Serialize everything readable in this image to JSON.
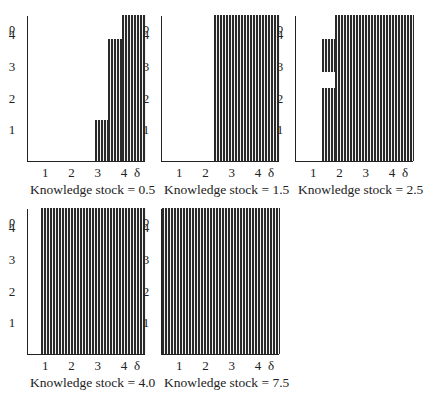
{
  "chart_data": [
    {
      "type": "area",
      "title": "Knowledge stock = 0.5",
      "xlabel": "δ",
      "ylabel": "ρ",
      "x_ticks": [
        "1",
        "2",
        "3",
        "4"
      ],
      "y_ticks": [
        "1",
        "2",
        "3",
        "4"
      ],
      "xlim": [
        0.3,
        4.8
      ],
      "ylim": [
        0,
        4.6
      ],
      "regions": [
        {
          "x_from": 2.85,
          "x_to": 3.35,
          "y_from": 0,
          "y_to": 1.3
        },
        {
          "x_from": 3.35,
          "x_to": 3.9,
          "y_from": 0,
          "y_to": 3.85
        },
        {
          "x_from": 3.9,
          "x_to": 4.8,
          "y_from": 0,
          "y_to": 4.6
        }
      ]
    },
    {
      "type": "area",
      "title": "Knowledge stock = 1.5",
      "xlabel": "δ",
      "ylabel": "ρ",
      "x_ticks": [
        "1",
        "2",
        "3",
        "4"
      ],
      "y_ticks": [
        "1",
        "2",
        "3",
        "4"
      ],
      "xlim": [
        0.3,
        4.8
      ],
      "ylim": [
        0,
        4.6
      ],
      "regions": [
        {
          "x_from": 2.3,
          "x_to": 4.8,
          "y_from": 0,
          "y_to": 4.6
        }
      ]
    },
    {
      "type": "area",
      "title": "Knowledge stock = 2.5",
      "xlabel": "δ",
      "ylabel": "ρ",
      "x_ticks": [
        "1",
        "2",
        "3",
        "4"
      ],
      "y_ticks": [
        "1",
        "2",
        "3",
        "4"
      ],
      "xlim": [
        0.3,
        4.8
      ],
      "ylim": [
        0,
        4.6
      ],
      "regions": [
        {
          "x_from": 1.3,
          "x_to": 1.8,
          "y_from": 0,
          "y_to": 2.3
        },
        {
          "x_from": 1.3,
          "x_to": 1.8,
          "y_from": 2.8,
          "y_to": 3.85
        },
        {
          "x_from": 1.8,
          "x_to": 4.8,
          "y_from": 0,
          "y_to": 4.6
        }
      ]
    },
    {
      "type": "area",
      "title": "Knowledge stock = 4.0",
      "xlabel": "δ",
      "ylabel": "ρ",
      "x_ticks": [
        "1",
        "2",
        "3",
        "4"
      ],
      "y_ticks": [
        "1",
        "2",
        "3",
        "4"
      ],
      "xlim": [
        0.3,
        4.8
      ],
      "ylim": [
        0,
        4.6
      ],
      "regions": [
        {
          "x_from": 0.8,
          "x_to": 4.8,
          "y_from": 0,
          "y_to": 4.6
        }
      ]
    },
    {
      "type": "area",
      "title": "Knowledge stock = 7.5",
      "xlabel": "δ",
      "ylabel": "ρ",
      "x_ticks": [
        "1",
        "2",
        "3",
        "4"
      ],
      "y_ticks": [
        "1",
        "2",
        "3",
        "4"
      ],
      "xlim": [
        0.3,
        4.8
      ],
      "ylim": [
        0,
        4.6
      ],
      "regions": [
        {
          "x_from": 0.3,
          "x_to": 4.8,
          "y_from": 0,
          "y_to": 4.6
        }
      ]
    }
  ],
  "axis": {
    "y_symbol": "ρ",
    "x_symbol": "δ",
    "ticks": [
      "1",
      "2",
      "3",
      "4"
    ]
  },
  "panels": [
    {
      "caption": "Knowledge stock = 0.5"
    },
    {
      "caption": "Knowledge stock = 1.5"
    },
    {
      "caption": "Knowledge stock = 2.5"
    },
    {
      "caption": "Knowledge stock = 4.0"
    },
    {
      "caption": "Knowledge stock = 7.5"
    }
  ]
}
